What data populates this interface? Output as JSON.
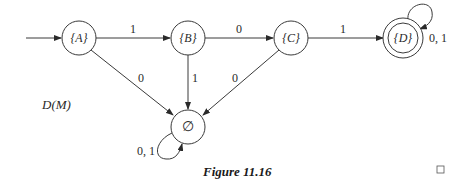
{
  "diagram": {
    "title": "D(M)",
    "caption": "Figure 11.16",
    "states": {
      "A": {
        "label": "{A}",
        "start": true,
        "accepting": false
      },
      "B": {
        "label": "{B}",
        "start": false,
        "accepting": false
      },
      "C": {
        "label": "{C}",
        "start": false,
        "accepting": false
      },
      "D": {
        "label": "{D}",
        "start": false,
        "accepting": true
      },
      "E": {
        "label": "∅",
        "start": false,
        "accepting": false
      }
    },
    "transitions": [
      {
        "from": "A",
        "to": "B",
        "label": "1"
      },
      {
        "from": "B",
        "to": "C",
        "label": "0"
      },
      {
        "from": "C",
        "to": "D",
        "label": "1"
      },
      {
        "from": "D",
        "to": "D",
        "label": "0, 1"
      },
      {
        "from": "A",
        "to": "E",
        "label": "0"
      },
      {
        "from": "B",
        "to": "E",
        "label": "1"
      },
      {
        "from": "C",
        "to": "E",
        "label": "0"
      },
      {
        "from": "E",
        "to": "E",
        "label": "0, 1"
      }
    ],
    "end_mark": "□"
  }
}
